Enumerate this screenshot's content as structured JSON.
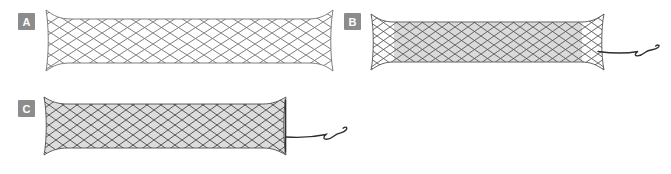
{
  "figure": {
    "type": "stent-illustration-figure",
    "panels": [
      {
        "label": "A",
        "illustration": "uncovered-mesh-stent"
      },
      {
        "label": "B",
        "illustration": "partially-covered-mesh-stent-with-retrieval-string"
      },
      {
        "label": "C",
        "illustration": "fully-covered-mesh-stent-with-retrieval-string"
      }
    ]
  },
  "colors": {
    "background": "#ffffff",
    "label_bg": "#8c8c8c",
    "label_text": "#ffffff",
    "mesh_wire": "#4f4f4f",
    "mesh_wire_light": "#6f6f6f",
    "covering": "#d6d6d6",
    "string": "#2e2e2e"
  }
}
